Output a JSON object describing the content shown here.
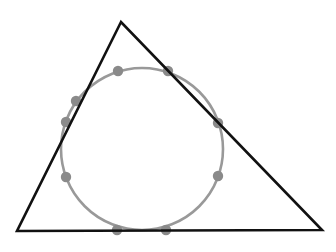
{
  "diagram": {
    "title": "",
    "background": "#ffffff",
    "triangle": {
      "vertices": [
        [
          121,
          22
        ],
        [
          17,
          231
        ],
        [
          322,
          230
        ]
      ],
      "stroke": "#111111",
      "stroke_width": 2.6
    },
    "circle": {
      "cx": 142,
      "cy": 149,
      "r": 81,
      "stroke": "#999999",
      "stroke_width": 2.6
    },
    "points": {
      "fill": "#8a8a8a",
      "r": 5.2,
      "items": [
        {
          "x": 118,
          "y": 71
        },
        {
          "x": 168,
          "y": 71
        },
        {
          "x": 76,
          "y": 101
        },
        {
          "x": 66,
          "y": 122
        },
        {
          "x": 218,
          "y": 123
        },
        {
          "x": 66,
          "y": 177
        },
        {
          "x": 218,
          "y": 176
        },
        {
          "x": 117,
          "y": 230
        },
        {
          "x": 166,
          "y": 230
        }
      ]
    }
  }
}
